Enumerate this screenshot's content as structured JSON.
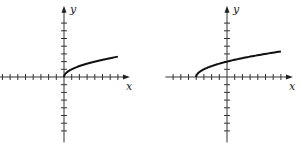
{
  "chart_data": [
    {
      "type": "line",
      "title": "",
      "xlabel": "x",
      "ylabel": "y",
      "function": "y = sqrt(x)",
      "domain": [
        0,
        7
      ],
      "x_ticks": [
        -8,
        -7,
        -6,
        -5,
        -4,
        -3,
        -2,
        -1,
        1,
        2,
        3,
        4,
        5,
        6,
        7
      ],
      "y_ticks": [
        -7,
        -6,
        -5,
        -4,
        -3,
        -2,
        -1,
        1,
        2,
        3,
        4,
        5,
        6,
        7
      ],
      "xlim": [
        -8.3,
        8.3
      ],
      "ylim": [
        -8.5,
        9
      ],
      "series": [
        {
          "name": "curve",
          "x": [
            0,
            0.25,
            1,
            2,
            3,
            4,
            5,
            6,
            7
          ],
          "y": [
            0,
            0.5,
            1,
            1.41,
            1.73,
            2,
            2.24,
            2.45,
            2.65
          ]
        }
      ],
      "grid": false,
      "tick_unit_px": 7.7,
      "origin_px": [
        64,
        77
      ]
    },
    {
      "type": "line",
      "title": "",
      "xlabel": "x",
      "ylabel": "y",
      "function": "y = sqrt(x + 4)",
      "domain": [
        -4,
        7
      ],
      "x_ticks": [
        -7,
        -6,
        -5,
        -4,
        -3,
        -2,
        -1,
        1,
        2,
        3,
        4,
        5,
        6,
        7
      ],
      "y_ticks": [
        -7,
        -6,
        -5,
        -4,
        -3,
        -2,
        -1,
        1,
        2,
        3,
        4,
        5,
        6,
        7
      ],
      "xlim": [
        -8,
        8.3
      ],
      "ylim": [
        -8.5,
        9
      ],
      "series": [
        {
          "name": "curve",
          "x": [
            -4,
            -3.75,
            -3,
            -2,
            -1,
            0,
            1,
            2,
            3,
            4,
            5,
            6,
            7
          ],
          "y": [
            0,
            0.5,
            1,
            1.41,
            1.73,
            2,
            2.24,
            2.45,
            2.65,
            2.83,
            3,
            3.16,
            3.32
          ]
        }
      ],
      "grid": false,
      "tick_unit_px": 7.7,
      "origin_px": [
        77,
        77
      ]
    }
  ],
  "graphs": [
    {
      "x_label": "x",
      "y_label": "y"
    },
    {
      "x_label": "x",
      "y_label": "y"
    }
  ]
}
